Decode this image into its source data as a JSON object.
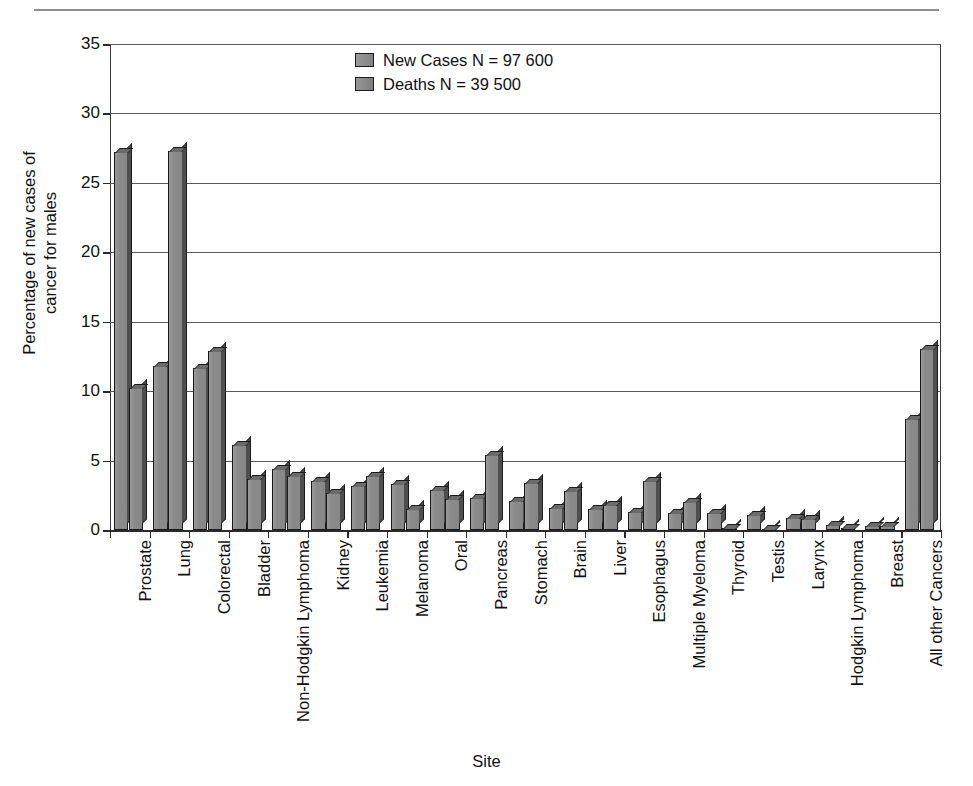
{
  "chart_data": {
    "type": "bar",
    "title": "",
    "xlabel": "Site",
    "ylabel": "Percentage of new cases of\ncancer for males",
    "ylim": [
      0,
      35
    ],
    "yticks": [
      0,
      5,
      10,
      15,
      20,
      25,
      30,
      35
    ],
    "ytick_labels": [
      "0",
      "5",
      "10",
      "15",
      "20",
      "25",
      "30",
      "35"
    ],
    "grid": true,
    "grid_axis": "y",
    "legend_position": "top-center",
    "orientation": "vertical",
    "bar_style": "3d-shadow",
    "categories": [
      "Prostate",
      "Lung",
      "Colorectal",
      "Bladder",
      "Non-Hodgkin Lymphoma",
      "Kidney",
      "Leukemia",
      "Melanoma",
      "Oral",
      "Pancreas",
      "Stomach",
      "Brain",
      "Liver",
      "Esophagus",
      "Multiple Myeloma",
      "Thyroid",
      "Testis",
      "Larynx",
      "Hodgkin Lymphoma",
      "Breast",
      "All other Cancers"
    ],
    "series": [
      {
        "name": "New Cases N = 97 600",
        "short_name": "New Cases",
        "color": "#8b8b8b",
        "values": [
          27.2,
          11.8,
          11.7,
          6.1,
          4.4,
          3.5,
          3.2,
          3.3,
          2.9,
          2.3,
          2.1,
          1.6,
          1.5,
          1.3,
          1.2,
          1.2,
          1.1,
          0.9,
          0.35,
          0.3,
          8.0
        ]
      },
      {
        "name": "Deaths N = 39 500",
        "short_name": "Deaths",
        "color": "#8b8b8b",
        "values": [
          10.2,
          27.3,
          12.9,
          3.7,
          3.9,
          2.7,
          3.9,
          1.5,
          2.2,
          5.4,
          3.4,
          2.8,
          1.8,
          3.5,
          2.0,
          0.12,
          0.08,
          0.8,
          0.15,
          0.3,
          13.0
        ]
      }
    ]
  },
  "legend": {
    "items": [
      {
        "label": "New Cases N = 97 600"
      },
      {
        "label": "Deaths N = 39 500"
      }
    ]
  },
  "axes": {
    "y_title": "Percentage of new cases of\ncancer for males",
    "x_title": "Site"
  }
}
